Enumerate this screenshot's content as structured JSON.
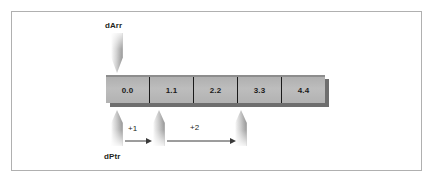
{
  "figure": {
    "type": "diagram",
    "background_color": "#ffffff",
    "frame_color": "#b0b0b0"
  },
  "labels": {
    "array_pointer": "dArr",
    "data_pointer": "dPtr"
  },
  "array": {
    "cell_fill": "#b5b5b5",
    "border_color": "#1a1a1a",
    "shadow_color": "#6e6e6e",
    "cells": [
      {
        "index": 0,
        "value": "0.0"
      },
      {
        "index": 1,
        "value": "1.1"
      },
      {
        "index": 2,
        "value": "2.2"
      },
      {
        "index": 3,
        "value": "3.3"
      },
      {
        "index": 4,
        "value": "4.4"
      }
    ]
  },
  "pointers": {
    "down": [
      {
        "name": "dArr",
        "target_cell": 0,
        "direction": "down"
      }
    ],
    "up": [
      {
        "name": "dPtr",
        "target_cell": 0,
        "direction": "up"
      },
      {
        "name": "dPtr+1",
        "target_cell": 1,
        "direction": "up"
      },
      {
        "name": "dPtr+3",
        "target_cell": 3,
        "direction": "up"
      }
    ]
  },
  "offsets": [
    {
      "label": "+1",
      "from_cell": 0,
      "to_cell": 1
    },
    {
      "label": "+2",
      "from_cell": 1,
      "to_cell": 3
    }
  ]
}
